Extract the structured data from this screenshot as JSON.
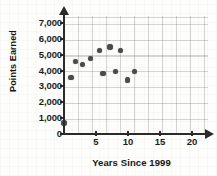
{
  "chart_data": {
    "type": "scatter",
    "title": "",
    "xlabel": "Years Since 1999",
    "ylabel": "Points Earned",
    "xlim": [
      0,
      22.5
    ],
    "ylim": [
      0,
      7450
    ],
    "grid": true,
    "legend": "none",
    "xticks": [
      5,
      10,
      15,
      20
    ],
    "xtick_labels": [
      "5",
      "10",
      "15",
      "20"
    ],
    "yticks": [
      0,
      1000,
      2000,
      3000,
      4000,
      5000,
      6000,
      7000
    ],
    "ytick_labels": [
      "0",
      "1,000",
      "2,000",
      "3,000",
      "4,000",
      "5,000",
      "6,000",
      "7,000"
    ],
    "point_color": "#4b4b4f",
    "axis_color": "#2b2b2b",
    "grid_color": "#787880",
    "points": [
      {
        "x": 0,
        "y": 700
      },
      {
        "x": 1.1,
        "y": 3570
      },
      {
        "x": 1.8,
        "y": 4580
      },
      {
        "x": 2.9,
        "y": 4380
      },
      {
        "x": 4.1,
        "y": 4780
      },
      {
        "x": 5.5,
        "y": 5280
      },
      {
        "x": 6.1,
        "y": 3830
      },
      {
        "x": 7.2,
        "y": 5500
      },
      {
        "x": 8.0,
        "y": 3960
      },
      {
        "x": 8.8,
        "y": 5280
      },
      {
        "x": 9.9,
        "y": 3420
      },
      {
        "x": 11.0,
        "y": 3960
      }
    ]
  }
}
